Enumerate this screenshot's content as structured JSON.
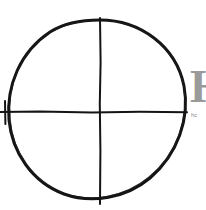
{
  "canvas": {
    "width": 206,
    "height": 210,
    "background_color": "#ffffff",
    "title": "Hand-drawn circle with crosshair"
  },
  "drawing": {
    "stroke_color": "#141414",
    "circle": {
      "label": "hand-drawn circle outline",
      "center_x": 100,
      "center_y": 112,
      "radius_x": 90,
      "radius_y": 89,
      "stroke_width": 3
    },
    "vertical_line": {
      "label": "vertical crosshair line",
      "x": 100,
      "y_start": 18,
      "y_end": 204,
      "stroke_width": 2
    },
    "horizontal_line": {
      "label": "horizontal crosshair line",
      "y": 112,
      "x_start": 0,
      "x_end": 187,
      "stroke_width": 2
    },
    "left_tick": {
      "label": "left end tick mark",
      "x": 5,
      "y_start": 101,
      "y_end": 124,
      "stroke_width": 2
    }
  },
  "watermark": {
    "glyph": "H",
    "glyph_color": "#9a9a9a",
    "caption": "hc",
    "caption_color": "#8d8d8d"
  }
}
